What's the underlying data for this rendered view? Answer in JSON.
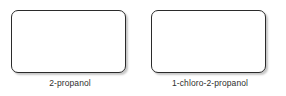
{
  "figure": {
    "background_color": "#ffffff",
    "box_border_color": "#2b2b2b",
    "box_fill_color": "#ffffff",
    "label_color": "#2e2e2e",
    "items": [
      {
        "label": "2-propanol",
        "box_content": ""
      },
      {
        "label": "1-chloro-2-propanol",
        "box_content": ""
      }
    ]
  }
}
